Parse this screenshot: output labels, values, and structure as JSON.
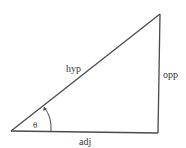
{
  "diagram": {
    "type": "right-triangle",
    "labels": {
      "hypotenuse": "hyp",
      "opposite": "opp",
      "adjacent": "adj",
      "angle": "θ"
    },
    "colors": {
      "stroke": "#4a4a4a",
      "text": "#333333",
      "background": "#ffffff"
    }
  }
}
